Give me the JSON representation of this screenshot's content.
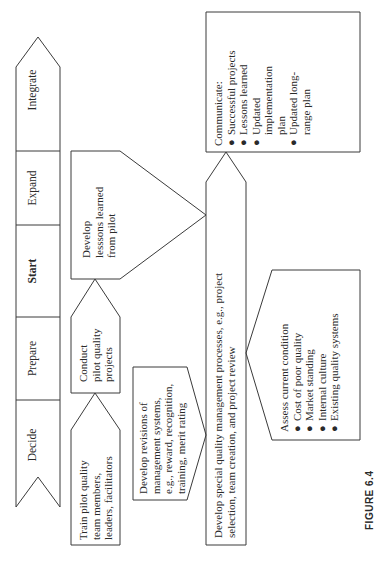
{
  "stages": [
    {
      "label": "Integrate",
      "bold": false
    },
    {
      "label": "Expand",
      "bold": false
    },
    {
      "label": "Start",
      "bold": true
    },
    {
      "label": "Prepare",
      "bold": false
    },
    {
      "label": "Decide",
      "bold": false
    }
  ],
  "boxes": {
    "train": {
      "lines": [
        "Train pilot quality",
        "team members,",
        "leaders, facilitators"
      ]
    },
    "conduct": {
      "lines": [
        "Conduct",
        "pilot quality",
        "projects"
      ]
    },
    "lessons": {
      "lines": [
        "Develop",
        "lesssons learned",
        "from pilot"
      ]
    },
    "revisions": {
      "lines": [
        "Develop revisions of",
        "management systems,",
        "e.g., reward, recognition,",
        "training, merit rating"
      ]
    },
    "processes": {
      "lines": [
        "Develop special quality management processes, e.g., project",
        "selection, team creation, and project review"
      ]
    },
    "assess": {
      "title": "Assess current condition",
      "bullets": [
        "Cost of poor quality",
        "Market standing",
        "Internal culture",
        "Existing quality systems"
      ]
    },
    "communicate": {
      "title": "Communicate:",
      "bullets": [
        "Successful projects",
        "Lessons learned",
        "Updated implementation plan",
        "Updated long-range plan"
      ],
      "bullet_lines": [
        [
          "Successful projects"
        ],
        [
          "Lessons learned"
        ],
        [
          "Updated",
          "implementation",
          "plan"
        ],
        [
          "Updated long-",
          "range plan"
        ]
      ]
    }
  },
  "bullet_glyph": "●",
  "caption": "FIGURE 6.4"
}
